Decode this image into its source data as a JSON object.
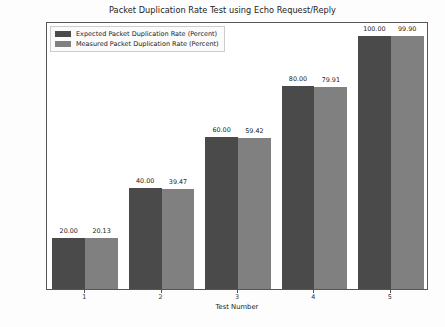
{
  "chart_data": {
    "type": "bar",
    "title": "Packet Duplication Rate Test using Echo Request/Reply",
    "xlabel": "Test Number",
    "ylabel": "Packet Duplication Rate in Percent",
    "categories": [
      "1",
      "2",
      "3",
      "4",
      "5"
    ],
    "series": [
      {
        "name": "Expected Packet Duplication Rate (Percent)",
        "color": "#4a4a4a",
        "values": [
          20.0,
          40.0,
          60.0,
          80.0,
          100.0
        ],
        "labels": [
          "20.00",
          "40.00",
          "60.00",
          "80.00",
          "100.00"
        ]
      },
      {
        "name": "Measured Packet Duplication Rate (Percent)",
        "color": "#808080",
        "values": [
          20.13,
          39.47,
          59.42,
          79.91,
          99.9
        ],
        "labels": [
          "20.13",
          "39.47",
          "59.42",
          "79.91",
          "99.90"
        ]
      }
    ],
    "ylim": [
      0,
      105
    ],
    "yticks": [
      0,
      20,
      40,
      60,
      80,
      100
    ],
    "ytick_labels": [
      "0",
      "20",
      "40",
      "60",
      "80",
      "100"
    ],
    "grid": false,
    "legend_position": "upper left"
  }
}
